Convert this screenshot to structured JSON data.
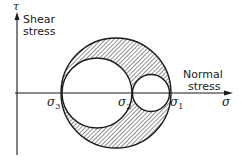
{
  "diagram": {
    "y_axis": {
      "symbol": "τ",
      "label_line1": "Shear",
      "label_line2": "stress"
    },
    "x_axis": {
      "symbol": "σ",
      "label_line1": "Normal",
      "label_line2": "stress"
    },
    "principal_stresses": [
      {
        "symbol": "σ",
        "subscript": "3"
      },
      {
        "symbol": "σ",
        "subscript": "2"
      },
      {
        "symbol": "σ",
        "subscript": "1"
      }
    ],
    "circles": [
      {
        "name": "outer-circle",
        "between": "σ3–σ1"
      },
      {
        "name": "left-inner-circle",
        "between": "σ3–σ2"
      },
      {
        "name": "right-inner-circle",
        "between": "σ2–σ1"
      }
    ],
    "shaded_region": "area inside outer circle, outside both inner circles",
    "colors": {
      "ink": "#1a1a1a",
      "hatch": "#333333",
      "background": "#ffffff"
    }
  }
}
